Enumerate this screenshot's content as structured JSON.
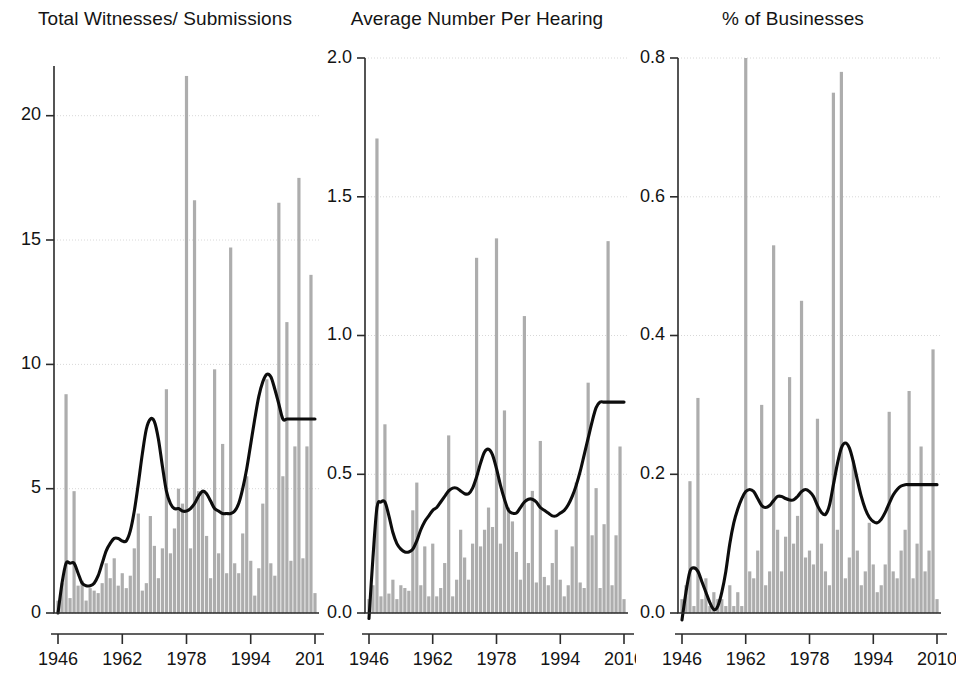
{
  "figure": {
    "width": 956,
    "height": 684,
    "background": "#ffffff",
    "bar_color": "#adadad",
    "line_color": "#0d0d0d",
    "grid_color": "#d8d8d8"
  },
  "panels": [
    {
      "key": "total",
      "title": "Total Witnesses/ Submissions",
      "left": 6,
      "width": 318,
      "plot": {
        "x": 48,
        "y": 66,
        "w": 265,
        "h": 547
      },
      "ylim": [
        0,
        22
      ],
      "yticks": [
        0,
        5,
        10,
        15,
        20
      ],
      "ytick_labels": [
        "0",
        "5",
        "10",
        "15",
        "20"
      ],
      "xlim": [
        1945,
        2011
      ],
      "xticks": [
        1946,
        1962,
        1978,
        1994,
        2010
      ],
      "xtick_labels": [
        "1946",
        "1962",
        "1978",
        "1994",
        "2010"
      ]
    },
    {
      "key": "average",
      "title": "Average Number Per Hearing",
      "left": 318,
      "width": 318,
      "plot": {
        "x": 47,
        "y": 58,
        "w": 263,
        "h": 555
      },
      "ylim": [
        0,
        2.0
      ],
      "yticks": [
        0,
        0.5,
        1.0,
        1.5,
        2.0
      ],
      "ytick_labels": [
        "0.0",
        "0.5",
        "1.0",
        "1.5",
        "2.0"
      ],
      "xlim": [
        1945,
        2011
      ],
      "xticks": [
        1946,
        1962,
        1978,
        1994,
        2010
      ],
      "xtick_labels": [
        "1946",
        "1962",
        "1978",
        "1994",
        "2010"
      ]
    },
    {
      "key": "businesses",
      "title": "% of Businesses",
      "left": 630,
      "width": 326,
      "plot": {
        "x": 48,
        "y": 58,
        "w": 263,
        "h": 555
      },
      "ylim": [
        0,
        0.8
      ],
      "yticks": [
        0,
        0.2,
        0.4,
        0.6,
        0.8
      ],
      "ytick_labels": [
        "0.0",
        "0.2",
        "0.4",
        "0.6",
        "0.8"
      ],
      "xlim": [
        1945,
        2011
      ],
      "xticks": [
        1946,
        1962,
        1978,
        1994,
        2010
      ],
      "xtick_labels": [
        "1946",
        "1962",
        "1978",
        "1994",
        "2010"
      ]
    }
  ],
  "chart_data": [
    {
      "type": "bar",
      "title": "Total Witnesses/ Submissions",
      "xlabel": "",
      "ylabel": "",
      "ylim": [
        0,
        22
      ],
      "xlim": [
        1945,
        2011
      ],
      "grid": true,
      "legend": "none",
      "x": [
        1946,
        1947,
        1948,
        1949,
        1950,
        1951,
        1952,
        1953,
        1954,
        1955,
        1956,
        1957,
        1958,
        1959,
        1960,
        1961,
        1962,
        1963,
        1964,
        1965,
        1966,
        1967,
        1968,
        1969,
        1970,
        1971,
        1972,
        1973,
        1974,
        1975,
        1976,
        1977,
        1978,
        1979,
        1980,
        1981,
        1982,
        1983,
        1984,
        1985,
        1986,
        1987,
        1988,
        1989,
        1990,
        1991,
        1992,
        1993,
        1994,
        1995,
        1996,
        1997,
        1998,
        1999,
        2000,
        2001,
        2002,
        2003,
        2004,
        2005,
        2006,
        2007,
        2008,
        2009,
        2010
      ],
      "series": [
        {
          "name": "Total Witnesses/ Submissions (bars)",
          "values": [
            0.5,
            1.2,
            8.8,
            0.6,
            4.9,
            1.1,
            1.3,
            0.5,
            1.0,
            0.9,
            0.8,
            1.2,
            2.0,
            1.4,
            2.2,
            1.1,
            1.6,
            1.0,
            1.5,
            2.6,
            4.0,
            0.9,
            1.2,
            3.9,
            2.7,
            1.4,
            2.6,
            9.0,
            2.4,
            3.4,
            5.0,
            4.4,
            21.6,
            2.6,
            16.6,
            4.9,
            4.9,
            3.1,
            1.4,
            9.8,
            2.4,
            6.8,
            1.6,
            14.7,
            2.0,
            1.6,
            3.2,
            5.5,
            2.1,
            0.7,
            1.8,
            4.4,
            9.4,
            2.0,
            1.5,
            16.5,
            5.5,
            11.7,
            2.1,
            6.7,
            17.5,
            2.2,
            6.7,
            13.6,
            0.8
          ]
        },
        {
          "name": "Smoothed trend",
          "type": "line",
          "values": [
            0.0,
            1.2,
            2.0,
            2.0,
            2.0,
            1.6,
            1.2,
            1.1,
            1.1,
            1.2,
            1.5,
            2.0,
            2.5,
            2.8,
            3.0,
            3.0,
            2.9,
            2.9,
            3.3,
            4.1,
            5.2,
            6.4,
            7.4,
            7.8,
            7.7,
            7.0,
            5.9,
            4.9,
            4.4,
            4.2,
            4.2,
            4.1,
            4.1,
            4.2,
            4.4,
            4.7,
            4.9,
            4.8,
            4.5,
            4.2,
            4.1,
            4.0,
            4.0,
            4.0,
            4.1,
            4.4,
            5.0,
            5.8,
            6.8,
            7.8,
            8.7,
            9.3,
            9.6,
            9.5,
            9.0,
            8.4,
            7.8,
            7.8,
            7.8,
            7.8,
            7.8,
            7.8,
            7.8,
            7.8,
            7.8
          ]
        }
      ]
    },
    {
      "type": "bar",
      "title": "Average Number Per Hearing",
      "xlabel": "",
      "ylabel": "",
      "ylim": [
        0,
        2.0
      ],
      "xlim": [
        1945,
        2011
      ],
      "grid": true,
      "legend": "none",
      "x": [
        1946,
        1947,
        1948,
        1949,
        1950,
        1951,
        1952,
        1953,
        1954,
        1955,
        1956,
        1957,
        1958,
        1959,
        1960,
        1961,
        1962,
        1963,
        1964,
        1965,
        1966,
        1967,
        1968,
        1969,
        1970,
        1971,
        1972,
        1973,
        1974,
        1975,
        1976,
        1977,
        1978,
        1979,
        1980,
        1981,
        1982,
        1983,
        1984,
        1985,
        1986,
        1987,
        1988,
        1989,
        1990,
        1991,
        1992,
        1993,
        1994,
        1995,
        1996,
        1997,
        1998,
        1999,
        2000,
        2001,
        2002,
        2003,
        2004,
        2005,
        2006,
        2007,
        2008,
        2009,
        2010
      ],
      "series": [
        {
          "name": "Average Number Per Hearing (bars)",
          "values": [
            0.05,
            0.1,
            1.71,
            0.06,
            0.68,
            0.07,
            0.12,
            0.05,
            0.1,
            0.09,
            0.08,
            0.37,
            0.47,
            0.1,
            0.24,
            0.06,
            0.25,
            0.06,
            0.09,
            0.18,
            0.64,
            0.06,
            0.12,
            0.3,
            0.2,
            0.12,
            0.25,
            1.28,
            0.24,
            0.3,
            0.38,
            0.31,
            1.35,
            0.25,
            0.73,
            0.38,
            0.33,
            0.22,
            0.12,
            1.07,
            0.18,
            0.44,
            0.11,
            0.62,
            0.13,
            0.1,
            0.18,
            0.3,
            0.12,
            0.06,
            0.1,
            0.24,
            0.47,
            0.11,
            0.09,
            0.83,
            0.28,
            0.45,
            0.09,
            0.32,
            1.34,
            0.1,
            0.28,
            0.6,
            0.05
          ]
        },
        {
          "name": "Smoothed trend",
          "type": "line",
          "values": [
            -0.02,
            0.2,
            0.38,
            0.4,
            0.4,
            0.35,
            0.29,
            0.25,
            0.23,
            0.22,
            0.22,
            0.23,
            0.26,
            0.3,
            0.33,
            0.35,
            0.37,
            0.38,
            0.4,
            0.42,
            0.44,
            0.45,
            0.45,
            0.44,
            0.43,
            0.43,
            0.45,
            0.49,
            0.54,
            0.58,
            0.59,
            0.57,
            0.52,
            0.46,
            0.41,
            0.37,
            0.36,
            0.36,
            0.38,
            0.4,
            0.41,
            0.41,
            0.4,
            0.38,
            0.37,
            0.36,
            0.35,
            0.35,
            0.36,
            0.37,
            0.39,
            0.42,
            0.46,
            0.51,
            0.57,
            0.63,
            0.69,
            0.74,
            0.76,
            0.76,
            0.76,
            0.76,
            0.76,
            0.76,
            0.76
          ]
        }
      ]
    },
    {
      "type": "bar",
      "title": "% of Businesses",
      "xlabel": "",
      "ylabel": "",
      "ylim": [
        0,
        0.8
      ],
      "xlim": [
        1945,
        2011
      ],
      "grid": true,
      "legend": "none",
      "x": [
        1946,
        1947,
        1948,
        1949,
        1950,
        1951,
        1952,
        1953,
        1954,
        1955,
        1956,
        1957,
        1958,
        1959,
        1960,
        1961,
        1962,
        1963,
        1964,
        1965,
        1966,
        1967,
        1968,
        1969,
        1970,
        1971,
        1972,
        1973,
        1974,
        1975,
        1976,
        1977,
        1978,
        1979,
        1980,
        1981,
        1982,
        1983,
        1984,
        1985,
        1986,
        1987,
        1988,
        1989,
        1990,
        1991,
        1992,
        1993,
        1994,
        1995,
        1996,
        1997,
        1998,
        1999,
        2000,
        2001,
        2002,
        2003,
        2004,
        2005,
        2006,
        2007,
        2008,
        2009,
        2010
      ],
      "series": [
        {
          "name": "% of Businesses (bars)",
          "values": [
            0.02,
            0.04,
            0.19,
            0.01,
            0.31,
            0.02,
            0.05,
            0.01,
            0.03,
            0.02,
            0.02,
            0.01,
            0.04,
            0.01,
            0.03,
            0.01,
            0.8,
            0.06,
            0.05,
            0.09,
            0.3,
            0.04,
            0.06,
            0.53,
            0.12,
            0.06,
            0.11,
            0.34,
            0.1,
            0.14,
            0.45,
            0.08,
            0.09,
            0.07,
            0.28,
            0.1,
            0.06,
            0.04,
            0.75,
            0.12,
            0.78,
            0.05,
            0.08,
            0.22,
            0.09,
            0.04,
            0.06,
            0.13,
            0.07,
            0.03,
            0.04,
            0.07,
            0.29,
            0.06,
            0.05,
            0.09,
            0.12,
            0.32,
            0.05,
            0.1,
            0.24,
            0.06,
            0.09,
            0.38,
            0.02
          ]
        },
        {
          "name": "Smoothed trend",
          "type": "line",
          "values": [
            -0.01,
            0.03,
            0.06,
            0.065,
            0.06,
            0.045,
            0.03,
            0.015,
            0.005,
            0.01,
            0.03,
            0.06,
            0.1,
            0.13,
            0.15,
            0.165,
            0.175,
            0.178,
            0.175,
            0.165,
            0.155,
            0.152,
            0.155,
            0.162,
            0.168,
            0.168,
            0.165,
            0.163,
            0.163,
            0.168,
            0.175,
            0.178,
            0.175,
            0.168,
            0.155,
            0.145,
            0.142,
            0.155,
            0.185,
            0.215,
            0.238,
            0.245,
            0.238,
            0.218,
            0.192,
            0.168,
            0.15,
            0.138,
            0.132,
            0.13,
            0.135,
            0.145,
            0.158,
            0.17,
            0.178,
            0.183,
            0.185,
            0.185,
            0.185,
            0.185,
            0.185,
            0.185,
            0.185,
            0.185,
            0.185
          ]
        }
      ]
    }
  ]
}
